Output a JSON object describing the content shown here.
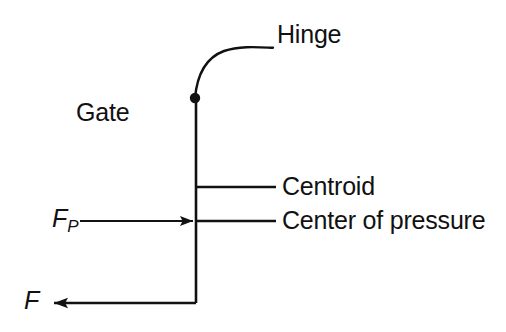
{
  "figure": {
    "type": "engineering-schematic",
    "background_color": "#ffffff",
    "ink_color": "#111111",
    "width": 506,
    "height": 332
  },
  "labels": {
    "hinge": "Hinge",
    "gate": "Gate",
    "centroid": "Centroid",
    "center_of_pressure": "Center of pressure",
    "force_pressure_symbol": "F",
    "force_pressure_subscript": "P",
    "force_symbol": "F"
  },
  "geometry": {
    "gate_line": {
      "x": 196,
      "y_top": 98,
      "y_bottom": 303
    },
    "hinge_point": {
      "x": 195,
      "y": 98,
      "radius": 5
    },
    "hinge_leader_curve": {
      "from_x": 195,
      "from_y": 98,
      "to_x": 273,
      "to_y": 48
    },
    "centroid_leader": {
      "x1": 196,
      "x2": 276,
      "y": 187
    },
    "center_of_pressure_leader": {
      "x1": 196,
      "x2": 276,
      "y": 221
    },
    "fp_arrow": {
      "x_start": 80,
      "x_tip": 194,
      "y": 221,
      "direction": "right"
    },
    "f_arrow": {
      "x_start": 196,
      "x_tip": 52,
      "y": 303,
      "direction": "left"
    }
  },
  "annotations": [
    {
      "name": "hinge",
      "text": "Hinge",
      "leader": "curved"
    },
    {
      "name": "gate",
      "text": "Gate",
      "leader": "none"
    },
    {
      "name": "centroid",
      "text": "Centroid",
      "leader": "straight-horizontal"
    },
    {
      "name": "center-of-pressure",
      "text": "Center of pressure",
      "leader": "straight-horizontal"
    },
    {
      "name": "resultant-pressure-force",
      "text": "F_P",
      "leader": "arrow-right"
    },
    {
      "name": "reaction-force",
      "text": "F",
      "leader": "arrow-left"
    }
  ]
}
